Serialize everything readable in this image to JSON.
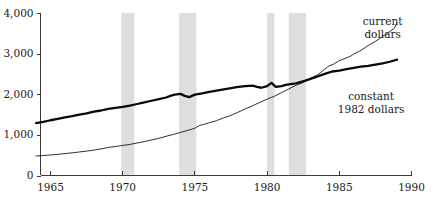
{
  "chart_data": {
    "type": "line",
    "title": "",
    "xlabel": "",
    "ylabel": "",
    "xlim": [
      1964,
      1990
    ],
    "ylim": [
      0,
      4000
    ],
    "grid": false,
    "legend_position": "inline-annotations",
    "yticks": [
      0,
      1000,
      2000,
      3000,
      4000
    ],
    "ytick_labels": [
      "0",
      "1,000",
      "2,000",
      "3,000",
      "4,000"
    ],
    "xticks": [
      1965,
      1970,
      1975,
      1980,
      1985,
      1990
    ],
    "xtick_labels": [
      "1965",
      "1970",
      "1975",
      "1980",
      "1985",
      "1990"
    ],
    "annotations": [
      {
        "name": "current-dollars-label",
        "line1": "current",
        "line2": "dollars",
        "x": 1988.0,
        "y": 3700
      },
      {
        "name": "constant-dollars-label",
        "line1": "constant",
        "line2": "1982 dollars",
        "x": 1987.2,
        "y": 1850
      }
    ],
    "shaded_bands": [
      {
        "name": "recession-1970",
        "start": 1969.9,
        "end": 1970.8
      },
      {
        "name": "recession-1974",
        "start": 1973.9,
        "end": 1975.1
      },
      {
        "name": "recession-1980",
        "start": 1980.0,
        "end": 1980.5
      },
      {
        "name": "recession-1981",
        "start": 1981.5,
        "end": 1982.7
      }
    ],
    "series": [
      {
        "name": "current dollars",
        "x": [
          1964.0,
          1964.5,
          1965.0,
          1965.5,
          1966.0,
          1966.5,
          1967.0,
          1967.5,
          1968.0,
          1968.5,
          1969.0,
          1969.5,
          1970.0,
          1970.5,
          1971.0,
          1971.5,
          1972.0,
          1972.5,
          1973.0,
          1973.5,
          1974.0,
          1974.5,
          1975.0,
          1975.3,
          1975.6,
          1976.0,
          1976.5,
          1977.0,
          1977.5,
          1978.0,
          1978.5,
          1979.0,
          1979.5,
          1980.0,
          1980.5,
          1981.0,
          1981.5,
          1982.0,
          1982.5,
          1983.0,
          1983.5,
          1984.0,
          1984.3,
          1984.6,
          1985.0,
          1985.4,
          1985.8,
          1986.0,
          1986.4,
          1986.8,
          1987.0,
          1987.4,
          1987.8,
          1988.0,
          1988.4,
          1988.8,
          1989.0
        ],
        "values": [
          480,
          492,
          505,
          520,
          540,
          558,
          580,
          600,
          625,
          655,
          690,
          715,
          740,
          765,
          800,
          835,
          875,
          915,
          965,
          1010,
          1060,
          1110,
          1165,
          1230,
          1255,
          1300,
          1350,
          1420,
          1480,
          1560,
          1640,
          1720,
          1800,
          1880,
          1950,
          2040,
          2130,
          2220,
          2290,
          2390,
          2480,
          2620,
          2700,
          2740,
          2830,
          2880,
          2940,
          2990,
          3060,
          3150,
          3200,
          3280,
          3370,
          3430,
          3520,
          3620,
          3760
        ]
      },
      {
        "name": "constant 1982 dollars",
        "x": [
          1964.0,
          1964.5,
          1965.0,
          1965.5,
          1966.0,
          1966.5,
          1967.0,
          1967.5,
          1968.0,
          1968.5,
          1969.0,
          1969.5,
          1970.0,
          1970.5,
          1971.0,
          1971.5,
          1972.0,
          1972.5,
          1973.0,
          1973.3,
          1973.6,
          1974.0,
          1974.3,
          1974.6,
          1975.0,
          1975.5,
          1976.0,
          1976.5,
          1977.0,
          1977.5,
          1978.0,
          1978.5,
          1979.0,
          1979.3,
          1979.6,
          1980.0,
          1980.3,
          1980.6,
          1981.0,
          1981.3,
          1981.6,
          1982.0,
          1982.3,
          1982.6,
          1983.0,
          1983.5,
          1984.0,
          1984.5,
          1985.0,
          1985.5,
          1986.0,
          1986.5,
          1987.0,
          1987.5,
          1988.0,
          1988.5,
          1989.0
        ],
        "values": [
          1290,
          1320,
          1360,
          1395,
          1430,
          1460,
          1500,
          1530,
          1570,
          1600,
          1640,
          1665,
          1690,
          1720,
          1760,
          1800,
          1840,
          1880,
          1920,
          1960,
          1990,
          2010,
          1960,
          1930,
          1990,
          2020,
          2060,
          2090,
          2120,
          2150,
          2180,
          2200,
          2210,
          2180,
          2160,
          2200,
          2280,
          2180,
          2200,
          2230,
          2250,
          2270,
          2300,
          2330,
          2380,
          2440,
          2500,
          2560,
          2580,
          2620,
          2650,
          2680,
          2700,
          2730,
          2760,
          2800,
          2850
        ]
      }
    ]
  }
}
